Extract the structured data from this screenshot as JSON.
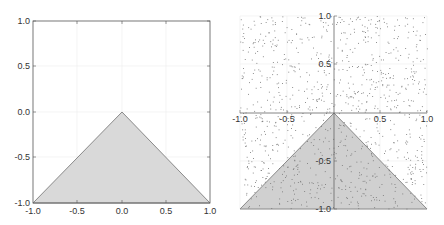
{
  "chart_data": [
    {
      "type": "area",
      "title": "",
      "xlabel": "",
      "ylabel": "",
      "xlim": [
        -1.0,
        1.0
      ],
      "ylim": [
        -1.0,
        1.0
      ],
      "grid": true,
      "frame": "boxed",
      "x_ticks": [
        "-1.0",
        "-0.5",
        "0.0",
        "0.5",
        "1.0"
      ],
      "y_ticks": [
        "-1.0",
        "-0.5",
        "0.0",
        "0.5",
        "1.0"
      ],
      "region": {
        "shape": "triangle",
        "vertices": [
          [
            -1.0,
            -1.0
          ],
          [
            0.0,
            0.0
          ],
          [
            1.0,
            -1.0
          ]
        ],
        "fill": "#d9d9d9",
        "edge": "#8a8a8a"
      }
    },
    {
      "type": "scatter",
      "title": "",
      "xlabel": "",
      "ylabel": "",
      "xlim": [
        -1.0,
        1.0
      ],
      "ylim": [
        -1.0,
        1.0
      ],
      "grid": true,
      "frame": "axes-through-origin",
      "x_ticks": [
        "-1.0",
        "-0.5",
        "0.5",
        "1.0"
      ],
      "y_ticks": [
        "-1.0",
        "-0.5",
        "0.5",
        "1.0"
      ],
      "points": {
        "description": "approximately 1000 uniformly random points in [-1,1]x[-1,1]",
        "count": 1000,
        "color": "#777777"
      },
      "region": {
        "shape": "triangle",
        "vertices": [
          [
            -1.0,
            -1.0
          ],
          [
            0.0,
            0.0
          ],
          [
            1.0,
            -1.0
          ]
        ],
        "fill": "#d0d0d0",
        "edge": "#8a8a8a"
      }
    }
  ],
  "left_plot": {
    "ticks_x": [
      "-1.0",
      "-0.5",
      "0.0",
      "0.5",
      "1.0"
    ],
    "ticks_y": [
      "1.0",
      "0.5",
      "0.0",
      "-0.5",
      "-1.0"
    ]
  },
  "right_plot": {
    "ticks_x": [
      "-1.0",
      "-0.5",
      "0.5",
      "1.0"
    ],
    "ticks_y": [
      "1.0",
      "0.5",
      "-0.5",
      "-1.0"
    ]
  }
}
